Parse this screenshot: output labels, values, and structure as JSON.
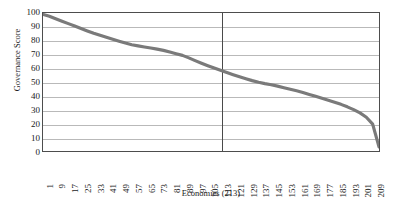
{
  "chart_data": {
    "type": "line",
    "title": "",
    "xlabel": "Economies (213)",
    "ylabel": "Governance Score",
    "xlim": [
      1,
      213
    ],
    "ylim": [
      0,
      100
    ],
    "grid": true,
    "legend": null,
    "series_color": "#7a7a7a",
    "frame_color": "#4d4d4d",
    "gridline_color": "#b9b9b9",
    "reference_line": {
      "orientation": "vertical",
      "x": 113,
      "color": "#4a4a4a"
    },
    "y_ticks": [
      0,
      10,
      20,
      30,
      40,
      50,
      60,
      70,
      80,
      90,
      100
    ],
    "x_ticks": [
      1,
      9,
      17,
      25,
      33,
      41,
      49,
      57,
      65,
      73,
      81,
      89,
      97,
      105,
      113,
      121,
      129,
      137,
      145,
      153,
      161,
      169,
      177,
      185,
      193,
      201,
      209
    ],
    "x": [
      1,
      5,
      9,
      13,
      17,
      21,
      25,
      29,
      33,
      37,
      41,
      45,
      49,
      53,
      57,
      61,
      65,
      69,
      73,
      77,
      81,
      85,
      89,
      93,
      97,
      101,
      105,
      109,
      113,
      117,
      121,
      125,
      129,
      133,
      137,
      141,
      145,
      149,
      153,
      157,
      161,
      165,
      169,
      173,
      177,
      181,
      185,
      189,
      193,
      197,
      201,
      205,
      209,
      213
    ],
    "values": [
      99.0,
      97.6,
      95.8,
      94.0,
      92.3,
      90.6,
      88.8,
      87.0,
      85.3,
      83.8,
      82.4,
      81.0,
      79.6,
      78.2,
      77.0,
      76.2,
      75.4,
      74.6,
      73.8,
      72.9,
      71.7,
      70.5,
      69.3,
      67.5,
      65.5,
      63.6,
      61.8,
      60.1,
      58.5,
      56.9,
      55.3,
      53.8,
      52.4,
      51.0,
      49.8,
      48.8,
      48.0,
      47.0,
      45.8,
      44.7,
      43.6,
      42.4,
      41.0,
      39.6,
      38.2,
      36.8,
      35.3,
      33.8,
      32.0,
      30.0,
      27.6,
      24.5,
      19.5,
      3.0
    ]
  }
}
